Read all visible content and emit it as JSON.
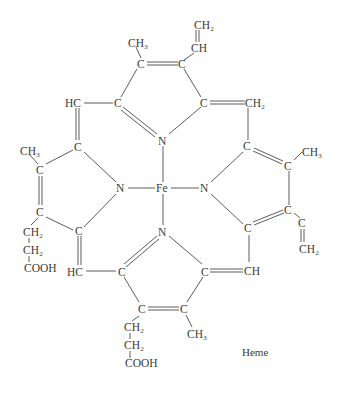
{
  "diagram": {
    "title": "Heme",
    "type": "chemical-structure",
    "atoms": {
      "vinyl1_ch2": "CH₂",
      "vinyl1_ch": "CH",
      "top_methyl": "CH₃",
      "top_c1": "C",
      "top_c2": "C",
      "top_c_alpha_left": "C",
      "top_c_alpha_right": "C",
      "meso_top_left": "HC",
      "meso_top_right": "CH₂",
      "n_top": "N",
      "fe": "Fe",
      "n_left": "N",
      "n_right": "N",
      "n_bottom": "N",
      "left_c_alpha_top": "C",
      "left_c_beta_top": "C",
      "left_methyl": "CH₃",
      "left_c_beta_bottom": "C",
      "left_c_alpha_bottom": "C",
      "left_prop_ch2_1": "CH₂",
      "left_prop_ch2_2": "CH₂",
      "left_prop_cooh": "COOH",
      "right_c_alpha_top": "C",
      "right_c_beta_top": "C",
      "right_methyl": "CH₃",
      "right_c_beta_bottom": "C",
      "right_c_alpha_bottom": "C",
      "right_vinyl_c": "C",
      "right_vinyl_ch2": "CH₂",
      "meso_bottom_left": "HC",
      "meso_bottom_right": "CH",
      "bottom_c_alpha_left": "C",
      "bottom_c_alpha_right": "C",
      "bottom_c_beta_left": "C",
      "bottom_c_beta_right": "C",
      "bottom_methyl": "CH₃",
      "bottom_prop_ch2_1": "CH₂",
      "bottom_prop_ch2_2": "CH₂",
      "bottom_prop_cooh": "COOH"
    }
  }
}
